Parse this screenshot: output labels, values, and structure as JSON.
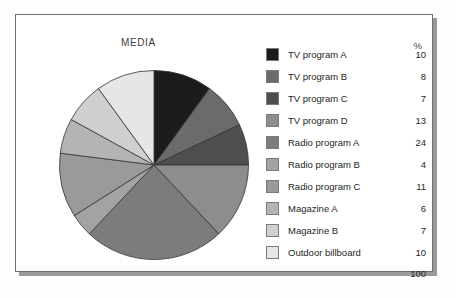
{
  "panel": {
    "title": "MEDIA",
    "percent_header": "%",
    "total_label": "100"
  },
  "chart_data": {
    "type": "pie",
    "title": "MEDIA",
    "unit": "%",
    "total": 100,
    "legend_position": "right",
    "start_angle_deg": 0,
    "direction": "clockwise",
    "categories": [
      "TV program A",
      "TV program B",
      "TV program C",
      "TV program D",
      "Radio program A",
      "Radio program B",
      "Radio program C",
      "Magazine A",
      "Magazine B",
      "Outdoor billboard"
    ],
    "values": [
      10,
      8,
      7,
      13,
      24,
      4,
      11,
      6,
      7,
      10
    ],
    "colors": [
      "#1c1c1c",
      "#6b6b6b",
      "#4f4f4f",
      "#8d8d8d",
      "#7c7c7c",
      "#a3a3a3",
      "#9a9a9a",
      "#b4b4b4",
      "#cfcfcf",
      "#e6e6e6"
    ]
  }
}
